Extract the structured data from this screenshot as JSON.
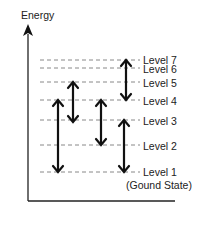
{
  "axis": {
    "label": "Energy"
  },
  "levels": [
    {
      "name": "Level 7",
      "y": 60
    },
    {
      "name": "Level 6",
      "y": 68
    },
    {
      "name": "Level 5",
      "y": 82
    },
    {
      "name": "Level 4",
      "y": 100
    },
    {
      "name": "Level 3",
      "y": 120
    },
    {
      "name": "Level 2",
      "y": 145
    },
    {
      "name": "Level 1",
      "y": 172,
      "note": "(Gound State)"
    }
  ],
  "transitions": [
    {
      "x": 58,
      "from": "Level 4",
      "to": "Level 1"
    },
    {
      "x": 73,
      "from": "Level 5",
      "to": "Level 3"
    },
    {
      "x": 101,
      "from": "Level 4",
      "to": "Level 2"
    },
    {
      "x": 126,
      "from": "Level 7",
      "to": "Level 4"
    },
    {
      "x": 124,
      "from": "Level 3",
      "to": "Level 1"
    }
  ]
}
